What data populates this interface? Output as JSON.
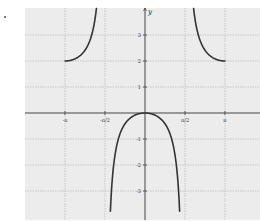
{
  "chart_data": {
    "type": "line",
    "title": "",
    "function": "y = 1 - sec(x)",
    "xlabel": "x",
    "ylabel": "y",
    "xlim": [
      -4.5,
      5.2
    ],
    "ylim": [
      -4.1,
      4.0
    ],
    "grid": true,
    "x_ticks": [
      {
        "value": -3.14159,
        "label": "-π"
      },
      {
        "value": -1.5708,
        "label": "-π/2"
      },
      {
        "value": 1.5708,
        "label": "π/2"
      },
      {
        "value": 3.14159,
        "label": "π"
      }
    ],
    "y_ticks": [
      {
        "value": 3,
        "label": "3"
      },
      {
        "value": 2,
        "label": "2"
      },
      {
        "value": 1,
        "label": "1"
      },
      {
        "value": -1,
        "label": "-1"
      },
      {
        "value": -2,
        "label": "-2"
      },
      {
        "value": -3,
        "label": "-3"
      }
    ],
    "asymptotes": [
      -1.5708,
      1.5708
    ],
    "series": [
      {
        "name": "left-upper-branch",
        "x": [
          -3.14,
          -2.9,
          -2.6,
          -2.3,
          -2.1,
          -1.95,
          -1.85
        ],
        "y": [
          2.0,
          2.03,
          2.16,
          2.5,
          2.98,
          3.6,
          4.0
        ]
      },
      {
        "name": "center-branch",
        "x": [
          -1.36,
          -1.2,
          -0.9,
          -0.6,
          -0.3,
          0,
          0.3,
          0.6,
          0.9,
          1.2,
          1.36
        ],
        "y": [
          -3.7,
          -1.76,
          -0.61,
          -0.21,
          -0.05,
          0,
          -0.05,
          -0.21,
          -0.61,
          -1.76,
          -3.7
        ]
      },
      {
        "name": "right-upper-branch",
        "x": [
          1.85,
          1.95,
          2.1,
          2.3,
          2.6,
          2.9,
          3.14
        ],
        "y": [
          4.0,
          3.6,
          2.98,
          2.5,
          2.16,
          2.03,
          2.0
        ]
      }
    ],
    "colors": {
      "grid": "#b8b8b8",
      "background": "#ececec",
      "curve": "#333333",
      "axis": "#444444"
    }
  }
}
